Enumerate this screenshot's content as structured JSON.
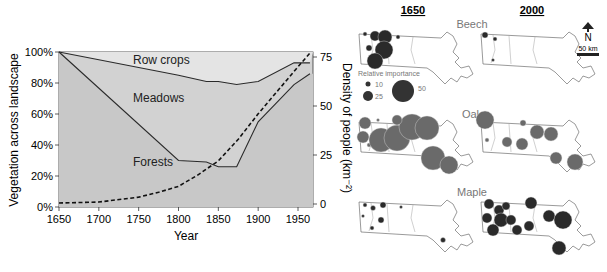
{
  "chart_data": {
    "type": "area",
    "title": "",
    "xlabel": "Year",
    "ylabel": "Vegetation across landscape",
    "ylabel_right": "Density of people (km⁻²)",
    "xlim": [
      1650,
      1965
    ],
    "ylim": [
      0,
      100
    ],
    "ylim_right": [
      0,
      75
    ],
    "x_ticks": [
      "1650",
      "1700",
      "1750",
      "1800",
      "1850",
      "1900",
      "1950"
    ],
    "y_ticks": [
      "0%",
      "20%",
      "40%",
      "60%",
      "80%",
      "100%"
    ],
    "y_ticks_right": [
      "0",
      "25",
      "50",
      "75"
    ],
    "grid": false,
    "region_labels": [
      "Row crops",
      "Meadows",
      "Forests"
    ],
    "series": [
      {
        "name": "Row crops / Meadows boundary",
        "axis": "left",
        "x": [
          1650,
          1800,
          1835,
          1850,
          1873,
          1900,
          1945,
          1965
        ],
        "values": [
          100,
          85,
          81,
          81,
          79,
          81,
          93,
          93
        ]
      },
      {
        "name": "Meadows / Forests boundary",
        "axis": "left",
        "x": [
          1650,
          1800,
          1835,
          1850,
          1873,
          1900,
          1945,
          1965
        ],
        "values": [
          100,
          30,
          29,
          26,
          26,
          55,
          79,
          86
        ]
      },
      {
        "name": "Density of people",
        "axis": "right",
        "style": "dashed",
        "x": [
          1650,
          1700,
          1750,
          1775,
          1800,
          1825,
          1850,
          1875,
          1900,
          1925,
          1950,
          1965
        ],
        "values": [
          0.5,
          1,
          3.5,
          6,
          9,
          15,
          22,
          33,
          46,
          58,
          70,
          77
        ]
      }
    ]
  },
  "maps": {
    "columns": [
      "1650",
      "2000"
    ],
    "rows": [
      "Beech",
      "Oak",
      "Maple"
    ],
    "legend": {
      "title": "Relative importance",
      "values": [
        "10",
        "25",
        "50"
      ]
    },
    "north_label": "N",
    "scale_label": "50 km"
  },
  "colors": {
    "forest_fill": "#c8c8c8",
    "rowcrop_fill": "#e4e4e4",
    "line": "#2a2a2a",
    "oak_circle": "#6a6a6a",
    "beech_maple_circle": "#2a2a2a"
  }
}
